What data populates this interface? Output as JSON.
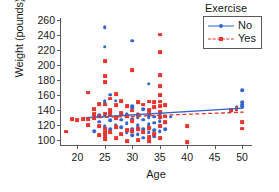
{
  "chart_data": {
    "type": "scatter",
    "title": "",
    "xlabel": "Age",
    "ylabel": "Weight (pounds)",
    "xlim": [
      17,
      52
    ],
    "ylim": [
      92,
      262
    ],
    "xticks": [
      20,
      25,
      30,
      35,
      40,
      45,
      50
    ],
    "yticks": [
      100,
      120,
      140,
      160,
      180,
      200,
      220,
      240,
      260
    ],
    "grid": false,
    "legend": {
      "title": "Exercise",
      "position": "top-right",
      "entries": [
        {
          "name": "No",
          "color": "#3366cc",
          "marker": "circle",
          "line": "solid"
        },
        {
          "name": "Yes",
          "color": "#e8342c",
          "marker": "square",
          "line": "dashed"
        }
      ]
    },
    "series": [
      {
        "name": "No",
        "color": "#3366cc",
        "marker": "circle",
        "points": [
          [
            25,
            250
          ],
          [
            25,
            224
          ],
          [
            30,
            232
          ],
          [
            33,
            175
          ],
          [
            50,
            166
          ],
          [
            26,
            160
          ],
          [
            25,
            152
          ],
          [
            25,
            150
          ],
          [
            27,
            152
          ],
          [
            30,
            143
          ],
          [
            30,
            145
          ],
          [
            32,
            141
          ],
          [
            50,
            147
          ],
          [
            50,
            145
          ],
          [
            49,
            144
          ],
          [
            35,
            133
          ],
          [
            37,
            131
          ],
          [
            33,
            133
          ],
          [
            31,
            134
          ],
          [
            29,
            134
          ],
          [
            28,
            135
          ],
          [
            26,
            137
          ],
          [
            25,
            132
          ],
          [
            24,
            133
          ],
          [
            27,
            131
          ],
          [
            31,
            130
          ],
          [
            33,
            130
          ],
          [
            34,
            131
          ],
          [
            30,
            128
          ],
          [
            32,
            127
          ],
          [
            28,
            127
          ],
          [
            26,
            126
          ],
          [
            24,
            124
          ],
          [
            35,
            125
          ],
          [
            34,
            123
          ],
          [
            33,
            121
          ],
          [
            31,
            120
          ],
          [
            29,
            122
          ],
          [
            27,
            120
          ],
          [
            25,
            118
          ],
          [
            23,
            112
          ],
          [
            25,
            109
          ],
          [
            30,
            115
          ],
          [
            32,
            114
          ],
          [
            34,
            113
          ],
          [
            33,
            110
          ],
          [
            31,
            108
          ],
          [
            29,
            110
          ],
          [
            35,
            112
          ],
          [
            36,
            123
          ],
          [
            34,
            105
          ],
          [
            32,
            103
          ],
          [
            30,
            106
          ],
          [
            28,
            117
          ],
          [
            26,
            114
          ],
          [
            35,
            119
          ],
          [
            33,
            117
          ],
          [
            31,
            116
          ],
          [
            36,
            114
          ],
          [
            50,
            150
          ]
        ]
      },
      {
        "name": "Yes",
        "color": "#e8342c",
        "marker": "square",
        "points": [
          [
            35,
            240
          ],
          [
            35,
            217
          ],
          [
            25,
            205
          ],
          [
            30,
            193
          ],
          [
            25,
            185
          ],
          [
            25,
            177
          ],
          [
            35,
            186
          ],
          [
            35,
            172
          ],
          [
            22,
            163
          ],
          [
            27,
            161
          ],
          [
            35,
            160
          ],
          [
            26,
            155
          ],
          [
            36,
            146
          ],
          [
            28,
            152
          ],
          [
            31,
            150
          ],
          [
            33,
            151
          ],
          [
            34,
            150
          ],
          [
            35,
            151
          ],
          [
            24,
            148
          ],
          [
            25,
            147
          ],
          [
            27,
            146
          ],
          [
            29,
            145
          ],
          [
            32,
            147
          ],
          [
            34,
            144
          ],
          [
            48,
            140
          ],
          [
            49,
            141
          ],
          [
            23,
            141
          ],
          [
            26,
            140
          ],
          [
            30,
            139
          ],
          [
            33,
            140
          ],
          [
            19,
            128
          ],
          [
            21,
            128
          ],
          [
            22,
            127
          ],
          [
            23,
            129
          ],
          [
            20,
            126
          ],
          [
            24,
            131
          ],
          [
            26,
            134
          ],
          [
            28,
            136
          ],
          [
            29,
            132
          ],
          [
            31,
            133
          ],
          [
            33,
            135
          ],
          [
            35,
            137
          ],
          [
            36,
            131
          ],
          [
            18,
            111
          ],
          [
            22,
            120
          ],
          [
            24,
            118
          ],
          [
            25,
            115
          ],
          [
            27,
            117
          ],
          [
            29,
            113
          ],
          [
            31,
            114
          ],
          [
            33,
            116
          ],
          [
            35,
            118
          ],
          [
            40,
            118
          ],
          [
            50,
            124
          ],
          [
            50,
            115
          ],
          [
            25,
            105
          ],
          [
            25,
            101
          ],
          [
            27,
            103
          ],
          [
            29,
            99
          ],
          [
            31,
            100
          ],
          [
            33,
            98
          ],
          [
            35,
            102
          ],
          [
            34,
            108
          ],
          [
            32,
            110
          ],
          [
            30,
            112
          ],
          [
            28,
            108
          ],
          [
            26,
            110
          ],
          [
            24,
            106
          ],
          [
            40,
            97
          ],
          [
            33,
            104
          ],
          [
            36,
            124
          ],
          [
            25,
            110
          ],
          [
            25,
            135
          ],
          [
            35,
            145
          ],
          [
            35,
            130
          ],
          [
            27,
            129
          ],
          [
            30,
            125
          ],
          [
            23,
            134
          ]
        ]
      }
    ],
    "fits": [
      {
        "name": "No",
        "color": "#3366cc",
        "style": "solid",
        "x": [
          21.5,
          50.5
        ],
        "y": [
          128.5,
          141.5
        ]
      },
      {
        "name": "Yes",
        "color": "#e8342c",
        "style": "dashed",
        "x": [
          21.5,
          50.5
        ],
        "y": [
          128.0,
          136.0
        ]
      }
    ]
  }
}
